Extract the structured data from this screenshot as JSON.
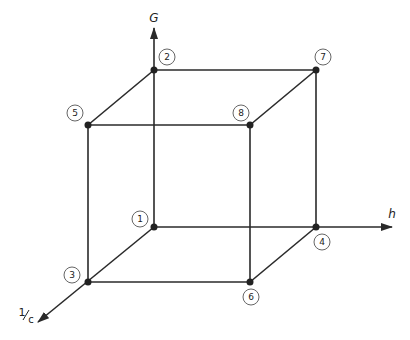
{
  "diagram": {
    "type": "cube-design-space",
    "colors": {
      "line": "#2a2a2a",
      "node": "#222222",
      "label_circle": "#555555",
      "background": "#ffffff"
    },
    "axes": [
      {
        "id": "G",
        "label": "G",
        "direction": "up"
      },
      {
        "id": "h",
        "label": "h",
        "direction": "right"
      },
      {
        "id": "inv_c",
        "label_num": "1",
        "label_den": "c",
        "label": "1/c",
        "direction": "down-left"
      }
    ],
    "vertices": [
      {
        "id": "1",
        "label": "1"
      },
      {
        "id": "2",
        "label": "2"
      },
      {
        "id": "3",
        "label": "3"
      },
      {
        "id": "4",
        "label": "4"
      },
      {
        "id": "5",
        "label": "5"
      },
      {
        "id": "6",
        "label": "6"
      },
      {
        "id": "7",
        "label": "7"
      },
      {
        "id": "8",
        "label": "8"
      }
    ],
    "edges": [
      [
        "1",
        "2"
      ],
      [
        "1",
        "3"
      ],
      [
        "1",
        "4"
      ],
      [
        "2",
        "5"
      ],
      [
        "2",
        "7"
      ],
      [
        "3",
        "5"
      ],
      [
        "3",
        "6"
      ],
      [
        "4",
        "6"
      ],
      [
        "4",
        "7"
      ],
      [
        "5",
        "8"
      ],
      [
        "6",
        "8"
      ],
      [
        "7",
        "8"
      ]
    ]
  }
}
